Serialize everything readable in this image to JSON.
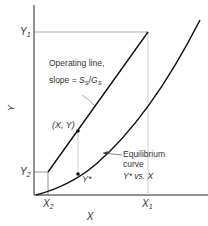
{
  "diagram": {
    "type": "operating-line-equilibrium-curve",
    "axes": {
      "x_label": "X",
      "y_label": "Y"
    },
    "ticks": {
      "y1": "Y",
      "y1_sub": "1",
      "y2": "Y",
      "y2_sub": "2",
      "x1": "X",
      "x1_sub": "1",
      "x2": "X",
      "x2_sub": "2"
    },
    "annotations": {
      "operating_line_1": "Operating line,",
      "operating_line_2_prefix": "slope = ",
      "slope_num": "S",
      "slope_num_sub": "S",
      "slope_sep": "/",
      "slope_den": "G",
      "slope_den_sub": "S",
      "point_xy": "(X, Y)",
      "point_ystar": "Y*",
      "equilibrium_1": "Equilibrium",
      "equilibrium_2": "curve",
      "equilibrium_3": "Y* vs. X"
    },
    "colors": {
      "line": "#111111",
      "guide": "#999999",
      "text": "#333333"
    }
  }
}
